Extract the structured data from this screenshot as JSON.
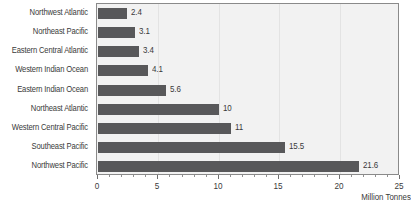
{
  "chart_data": {
    "type": "bar",
    "orientation": "horizontal",
    "title": "",
    "xlabel": "Million Tonnes",
    "ylabel": "",
    "xlim": [
      0,
      25
    ],
    "xticks": [
      0,
      5,
      10,
      15,
      20,
      25
    ],
    "xtick_labels": [
      "0",
      "5",
      "10",
      "15",
      "20",
      "25"
    ],
    "minor_tick_step": 1,
    "grid": true,
    "grid_axis": "x",
    "legend": false,
    "categories": [
      "Northwest Atlantic",
      "Northeast Pacific",
      "Eastern Central Atlantic",
      "Western Indian Ocean",
      "Eastern Indian Ocean",
      "Northeast Atlantic",
      "Western Central Pacific",
      "Southeast Pacific",
      "Northwest Pacific"
    ],
    "values": [
      2.4,
      3.1,
      3.4,
      4.1,
      5.6,
      10,
      11,
      15.5,
      21.6
    ],
    "value_labels": [
      "2.4",
      "3.1",
      "3.4",
      "4.1",
      "5.6",
      "10",
      "11",
      "15.5",
      "21.6"
    ],
    "colors": {
      "bar": "#58585a",
      "plot_background": "#f2f2f2",
      "plot_border": "#8a8a8a",
      "text": "#3a3a3a",
      "gridline": "#e3e3e3",
      "page_background": "#ffffff"
    }
  }
}
